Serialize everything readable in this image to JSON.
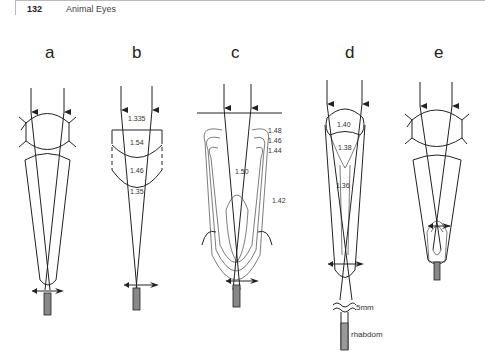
{
  "header": {
    "page_number": "132",
    "running_title": "Animal Eyes"
  },
  "figure": {
    "panels": [
      {
        "label": "a",
        "refractive_indices": []
      },
      {
        "label": "b",
        "refractive_indices": [
          "1.335",
          "1.54",
          "1.46",
          "1.35"
        ]
      },
      {
        "label": "c",
        "refractive_indices": [
          "1.48",
          "1.46",
          "1.44",
          "1.50",
          "1.42"
        ]
      },
      {
        "label": "d",
        "refractive_indices": [
          "1.40",
          "1.38",
          "1.36"
        ],
        "annotations": [
          "5mm",
          "rhabdom"
        ]
      },
      {
        "label": "e",
        "refractive_indices": []
      }
    ]
  },
  "colors": {
    "ink": "#222222",
    "background": "#ffffff"
  }
}
